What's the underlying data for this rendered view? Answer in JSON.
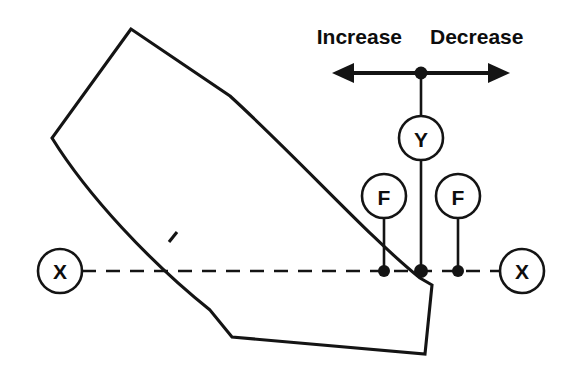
{
  "diagram": {
    "colors": {
      "stroke": "#141414",
      "fill_white": "#ffffff",
      "text": "#0d0d0d"
    },
    "header_labels": {
      "increase": "Increase",
      "decrease": "Decrease"
    },
    "nodes": {
      "axis_left_label": "X",
      "axis_right_label": "X",
      "resultant_label": "Y",
      "force_left_label": "F",
      "force_right_label": "F"
    },
    "geometry": {
      "axis_y": 271,
      "axis_left_circle_x": 60,
      "axis_right_circle_x": 522,
      "node_radius": 22,
      "force_left_x": 384,
      "center_x": 421,
      "force_right_x": 458,
      "resultant_circle_y": 138,
      "force_circle_y": 196,
      "arrow_y": 73,
      "arrow_left_tip_x": 332,
      "arrow_right_tip_x": 510
    }
  }
}
